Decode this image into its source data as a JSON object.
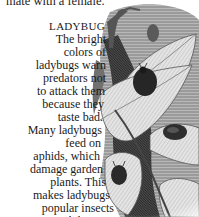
{
  "page": {
    "top_fragment": "mate with a female.",
    "caption": {
      "title": "LADYBUG",
      "lines": [
        "The bright",
        "colors of",
        "ladybugs warn",
        "predators not",
        "to attack them",
        "because they",
        "taste bad.",
        "Many ladybugs",
        "feed on",
        "aphids, which",
        "damage garden",
        "plants. This",
        "makes ladybugs",
        "popular insects",
        "with humans."
      ]
    },
    "illustration": {
      "subject": "ladybugs on leaves engraving",
      "tone_dark": "#2b2b2b",
      "tone_mid": "#8a8a8a",
      "tone_light": "#d6d6d6",
      "background": "#ffffff"
    }
  }
}
